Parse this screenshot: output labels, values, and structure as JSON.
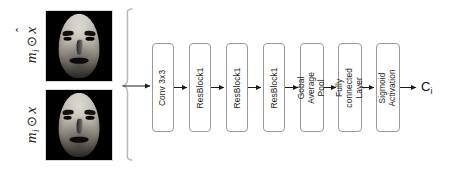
{
  "diagram": {
    "background_color": "#ffffff",
    "block_border_color": "#9a9a9a",
    "arrow_color": "#1a1a1a",
    "text_color": "#1c1c1c"
  },
  "inputs": {
    "top": {
      "label_base": "m",
      "label_sub": "i",
      "operator": "⊙",
      "operand": "x",
      "operand_accent": "̂",
      "label_plain": "m_i ⊙ x̂",
      "image_alt": "masked reconstructed face"
    },
    "bottom": {
      "label_base": "m",
      "label_sub": "i",
      "operator": "⊙",
      "operand": "x",
      "operand_accent": "",
      "label_plain": "m_i ⊙ x",
      "image_alt": "masked input face"
    }
  },
  "pipeline": {
    "blocks": [
      {
        "id": "conv3x3",
        "label": "Conv 3x3",
        "lines": [
          "Conv 3x3"
        ],
        "two_line": false
      },
      {
        "id": "resblock1a",
        "label": "ResBlock1",
        "lines": [
          "ResBlock1"
        ],
        "two_line": false
      },
      {
        "id": "resblock1b",
        "label": "ResBlock1",
        "lines": [
          "ResBlock1"
        ],
        "two_line": false
      },
      {
        "id": "resblock1c",
        "label": "ResBlock1",
        "lines": [
          "ResBlock1"
        ],
        "two_line": false
      },
      {
        "id": "gap",
        "label": "Gobal Average Pool",
        "lines": [
          "Gobal Average",
          "Pool"
        ],
        "two_line": true
      },
      {
        "id": "fc",
        "label": "Fully connected Layer",
        "lines": [
          "Fully connected",
          "Layer"
        ],
        "two_line": true
      },
      {
        "id": "sigmoid",
        "label": "Sigmoid Activation",
        "lines": [
          "Sigmoid",
          "Activation"
        ],
        "two_line": true
      }
    ]
  },
  "output": {
    "base": "C",
    "sub": "i",
    "plain": "C_i"
  }
}
